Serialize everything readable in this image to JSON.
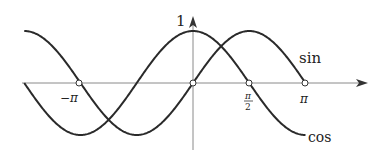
{
  "diagram": {
    "curves": [
      {
        "name": "sin",
        "label": "sin",
        "domain": [
          "-3π/2",
          "π"
        ]
      },
      {
        "name": "cos",
        "label": "cos",
        "domain": [
          "-3π/2",
          "π"
        ]
      }
    ],
    "axis": {
      "y_label": "1",
      "x_ticks": [
        {
          "label": "−π",
          "value": "-π"
        },
        {
          "label": "π/2",
          "numerator": "π",
          "denominator": "2",
          "value": "π/2"
        },
        {
          "label": "π",
          "value": "π"
        }
      ]
    },
    "marked_points": [
      "(-π, 0)",
      "(0, 0)",
      "(π/2, 0)",
      "(π, 0)"
    ],
    "colors": {
      "curve": "#2a2a2a",
      "axis": "#8a8a8a",
      "text": "#222222"
    }
  }
}
